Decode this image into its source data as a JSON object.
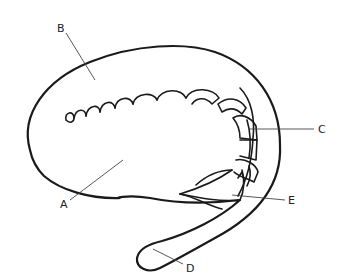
{
  "diagram": {
    "type": "labeled anatomical line drawing",
    "labels": [
      {
        "id": "A",
        "text": "A",
        "x": 62,
        "y": 204
      },
      {
        "id": "B",
        "text": "B",
        "x": 58,
        "y": 30
      },
      {
        "id": "C",
        "text": "C",
        "x": 318,
        "y": 131
      },
      {
        "id": "D",
        "text": "D",
        "x": 187,
        "y": 268
      },
      {
        "id": "E",
        "text": "E",
        "x": 288,
        "y": 204
      }
    ],
    "colors": {
      "line": "#1a1a1a",
      "background": "#ffffff"
    }
  }
}
